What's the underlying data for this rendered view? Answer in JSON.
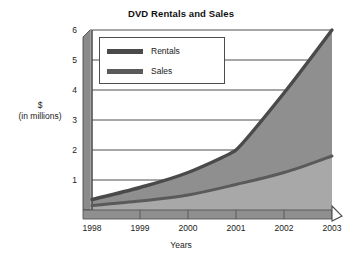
{
  "chart_data": {
    "type": "area",
    "title": "DVD Rentals and Sales",
    "xlabel": "Years",
    "ylabel": "$ (in millions)",
    "ylabel_line1": "$",
    "ylabel_line2": "(in millions)",
    "categories": [
      "1998",
      "1999",
      "2000",
      "2001",
      "2002",
      "2003"
    ],
    "x": [
      1998,
      1999,
      2000,
      2001,
      2002,
      2003
    ],
    "xlim": [
      1998,
      2003
    ],
    "ylim": [
      0,
      6
    ],
    "yticks": [
      "1",
      "2",
      "3",
      "4",
      "5",
      "6"
    ],
    "ytick_values": [
      1,
      2,
      3,
      4,
      5,
      6
    ],
    "grid": true,
    "legend_position": "top-left",
    "series": [
      {
        "name": "Rentals",
        "color": "#4a4a4a",
        "fill": "#8f8f8f",
        "values": [
          0.35,
          0.75,
          1.25,
          2.0,
          3.9,
          6.0
        ]
      },
      {
        "name": "Sales",
        "color": "#5a5a5a",
        "fill": "#a8a8a8",
        "values": [
          0.15,
          0.3,
          0.5,
          0.85,
          1.25,
          1.8
        ]
      }
    ]
  },
  "legend": {
    "items": [
      {
        "label": "Rentals"
      },
      {
        "label": "Sales"
      }
    ]
  },
  "colors": {
    "axis": "#4d4d4d",
    "gridline": "#3a3a3a",
    "band_upper_fill": "#8f8f8f",
    "band_lower_fill": "#a8a8a8",
    "rentals_line": "#4a4a4a",
    "sales_line": "#5a5a5a",
    "axis_slab_light": "#b5b5b5",
    "axis_slab_dark": "#8a8a8a",
    "background": "#ffffff",
    "text": "#1a1a1a"
  }
}
